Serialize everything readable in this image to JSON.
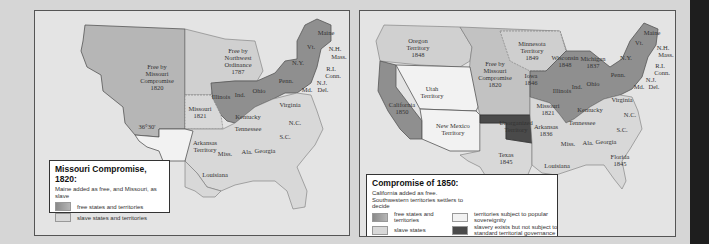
{
  "colors": {
    "background": "#d6d6d6",
    "map_background": "#e4e4e4",
    "free": "#8f8f8f",
    "free_territory": "#b6b6b6",
    "slave": "#d2d2d2",
    "popular_sovereignty": "#f2f2f2",
    "unorganized": "#4a4a4a",
    "border": "#555555"
  },
  "map_left": {
    "legend": {
      "title": "Missouri Compromise, 1820:",
      "subtitle": "Maine added as free, and Missouri, as slave",
      "items": [
        {
          "label": "free states and territories",
          "color": "#8f8f8f"
        },
        {
          "label": "slave states and territories",
          "color": "#d8d8d8"
        }
      ]
    },
    "labels": {
      "missouri_compromise": [
        "Free by",
        "Missouri",
        "Compromise",
        "1820"
      ],
      "northwest_ordinance": [
        "Free by",
        "Northwest",
        "Ordinance",
        "1787"
      ],
      "missouri": [
        "Missouri",
        "1821"
      ],
      "arkansas": [
        "Arkansas",
        "Territory"
      ],
      "latitude": "36°30'",
      "illinois": "Illinois",
      "indiana": "Ind.",
      "ohio": "Ohio",
      "penn": "Penn.",
      "ny": "N.Y.",
      "vt": "Vt.",
      "maine": "Maine",
      "nh": "N.H.",
      "mass": "Mass.",
      "ri": "R.I.",
      "conn": "Conn.",
      "nj": "N.J.",
      "del": "Del.",
      "md": "Md.",
      "virginia": "Virginia",
      "kentucky": "Kentucky",
      "tennessee": "Tennessee",
      "nc": "N.C.",
      "sc": "S.C.",
      "georgia": "Georgia",
      "alabama": "Ala.",
      "mississippi": "Miss.",
      "louisiana": "Louisiana"
    }
  },
  "map_right": {
    "legend": {
      "title": "Compromise of 1850:",
      "subtitle": "California added as free. Southwestern territories settlers to decide",
      "items": [
        {
          "label": "free states and territories",
          "color": "#8f8f8f"
        },
        {
          "label": "territories subject to popular sovereignity",
          "color": "#f2f2f2"
        },
        {
          "label": "slave states",
          "color": "#d8d8d8"
        },
        {
          "label": "slavery exists but not subject to standard territorial governance",
          "color": "#4a4a4a"
        }
      ]
    },
    "labels": {
      "oregon": [
        "Oregon",
        "Territory",
        "1848"
      ],
      "minnesota": [
        "Minnesota",
        "Territory",
        "1849"
      ],
      "missouri_compromise": [
        "Free by",
        "Missouri",
        "Compromise",
        "1820"
      ],
      "utah": [
        "Utah",
        "Territory"
      ],
      "new_mexico": [
        "New Mexico",
        "Territory"
      ],
      "california": [
        "California",
        "1850"
      ],
      "unorganized": [
        "Unorganized",
        "Territory"
      ],
      "texas": [
        "Texas",
        "1845"
      ],
      "iowa": [
        "Iowa",
        "1846"
      ],
      "wisconsin": [
        "Wisconsin",
        "1848"
      ],
      "michigan": [
        "Michigan",
        "1837"
      ],
      "missouri": [
        "Missouri",
        "1821"
      ],
      "arkansas": [
        "Arkansas",
        "1836"
      ],
      "florida": [
        "Florida",
        "1845"
      ],
      "illinois": "Illinois",
      "indiana": "Ind.",
      "ohio": "Ohio",
      "penn": "Penn.",
      "ny": "N.Y.",
      "vt": "Vt.",
      "maine": "Maine",
      "nh": "N.H.",
      "mass": "Mass.",
      "ri": "R.I.",
      "conn": "Conn.",
      "nj": "N.J.",
      "del": "Del.",
      "md": "Md.",
      "virginia": "Virginia",
      "kentucky": "Kentucky",
      "tennessee": "Tennessee",
      "nc": "N.C.",
      "sc": "S.C.",
      "georgia": "Georgia",
      "alabama": "Ala.",
      "mississippi": "Miss.",
      "louisiana": "Louisiana"
    }
  }
}
